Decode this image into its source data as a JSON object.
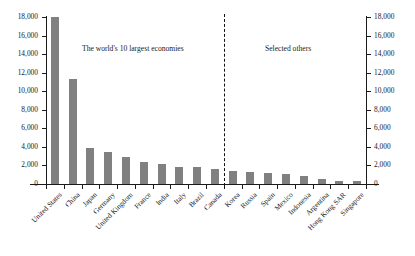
{
  "chart_data": {
    "type": "bar",
    "title": "",
    "xlabel": "",
    "ylabel": "",
    "ylim": [
      0,
      18000
    ],
    "ytick_step": 2000,
    "grid": false,
    "legend": null,
    "dual_axis": true,
    "bar_color": "#808080",
    "categories": [
      "United States",
      "China",
      "Japan",
      "Germany",
      "United Kingdom",
      "France",
      "India",
      "Italy",
      "Brazil",
      "Canada",
      "Korea",
      "Russia",
      "Spain",
      "Mexico",
      "Indonesia",
      "Argentina",
      "Hong Kong SAR",
      "Singapore"
    ],
    "values": [
      18000,
      11300,
      3900,
      3400,
      2900,
      2400,
      2200,
      1850,
      1800,
      1600,
      1400,
      1300,
      1200,
      1100,
      900,
      550,
      320,
      300
    ],
    "ytick_labels": [
      "18,000",
      "16,000",
      "14,000",
      "12,000",
      "10,000",
      "8,000",
      "6,000",
      "4,000",
      "2,000",
      "0"
    ],
    "annotations": [
      {
        "text": "The world's 10 largest economies",
        "group": "left"
      },
      {
        "text": "Selected others",
        "group": "right"
      }
    ],
    "divider": {
      "after_category": "Canada",
      "style": "dashed"
    }
  }
}
